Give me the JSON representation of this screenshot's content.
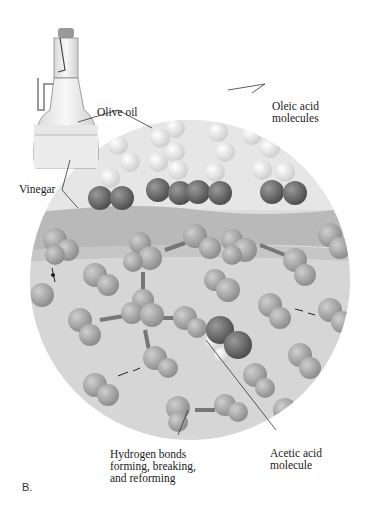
{
  "figure": {
    "panel_label": "B.",
    "labels": {
      "olive_oil": "Olive oil",
      "vinegar": "Vinegar",
      "oleic_acid": "Oleic acid\nmolecules",
      "hydrogen_bonds": "Hydrogen bonds\nforming, breaking,\nand reforming",
      "acetic_acid": "Acetic acid\nmolecule"
    },
    "colors": {
      "circle_fill": "#d9d9d9",
      "interface_band": "#b8b8b8",
      "water_molecule": "#a6a6a6",
      "oxygen_dark": "#6e6e6e",
      "hydrogen_light": "#f2f2f2",
      "bottle_glass": "#eeeeee",
      "leader_line": "#333333"
    }
  }
}
